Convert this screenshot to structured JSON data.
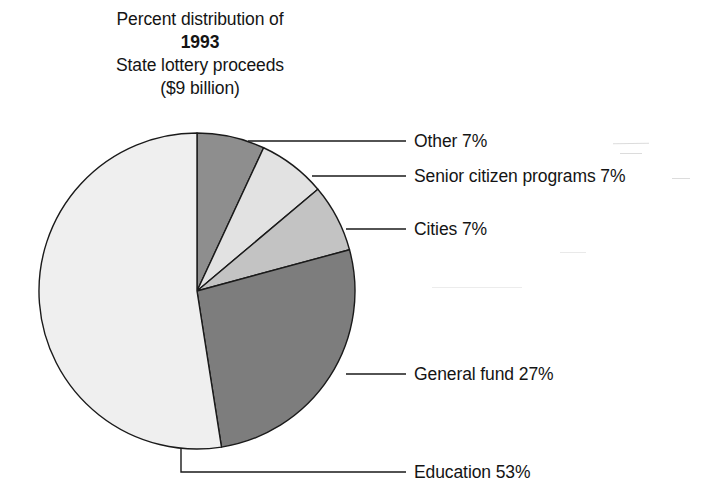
{
  "title": {
    "lines": [
      "Percent distribution of",
      "1993",
      "State lottery proceeds",
      "($9 billion)"
    ],
    "bold_line_index": 1
  },
  "chart_data": {
    "type": "pie",
    "title": "Percent distribution of 1993 State lottery proceeds ($9 billion)",
    "subtitle": "($9 billion)",
    "year": "1993",
    "total_label": "$9 billion",
    "unit": "percent",
    "start_angle_deg": 0,
    "direction": "clockwise",
    "grid": false,
    "legend": "callout-labels-right",
    "categories": [
      "Other",
      "Senior citizen programs",
      "Cities",
      "General fund",
      "Education"
    ],
    "values": [
      7,
      7,
      7,
      27,
      53
    ],
    "slices": [
      {
        "name": "Other",
        "label": "Other 7%",
        "value": 7,
        "percent_text": "7%",
        "color": "#8e8e8e",
        "start_deg": 0,
        "end_deg": 25.2,
        "leader": {
          "type": "straight",
          "from_x": 248,
          "from_y": 141,
          "to_x": 406,
          "to_y": 141
        },
        "text_x": 414,
        "text_y": 131
      },
      {
        "name": "Senior citizen programs",
        "label": "Senior citizen programs 7%",
        "value": 7,
        "percent_text": "7%",
        "color": "#e2e2e2",
        "start_deg": 25.2,
        "end_deg": 50.4,
        "leader": {
          "type": "straight",
          "from_x": 312,
          "from_y": 176,
          "to_x": 406,
          "to_y": 176
        },
        "text_x": 414,
        "text_y": 166
      },
      {
        "name": "Cities",
        "label": "Cities 7%",
        "value": 7,
        "percent_text": "7%",
        "color": "#c3c3c3",
        "start_deg": 50.4,
        "end_deg": 75.6,
        "leader": {
          "type": "straight",
          "from_x": 346,
          "from_y": 229,
          "to_x": 406,
          "to_y": 229
        },
        "text_x": 414,
        "text_y": 219
      },
      {
        "name": "General fund",
        "label": "General fund 27%",
        "value": 27,
        "percent_text": "27%",
        "color": "#7d7d7d",
        "start_deg": 75.6,
        "end_deg": 172.8,
        "leader": {
          "type": "straight",
          "from_x": 346,
          "from_y": 374,
          "to_x": 406,
          "to_y": 374
        },
        "text_x": 414,
        "text_y": 364
      },
      {
        "name": "Education",
        "label": "Education 53%",
        "value": 53,
        "percent_text": "53%",
        "color": "#efefef",
        "start_deg": 172.8,
        "end_deg": 360,
        "leader": {
          "type": "bent",
          "from_x": 181,
          "from_y": 448,
          "elbow_y": 472,
          "to_x": 406,
          "to_y": 472
        },
        "text_x": 414,
        "text_y": 462
      }
    ],
    "geometry": {
      "center_x": 197,
      "center_y": 291,
      "radius": 158,
      "stroke": "#1a1a1a",
      "stroke_width": 1.4
    }
  }
}
